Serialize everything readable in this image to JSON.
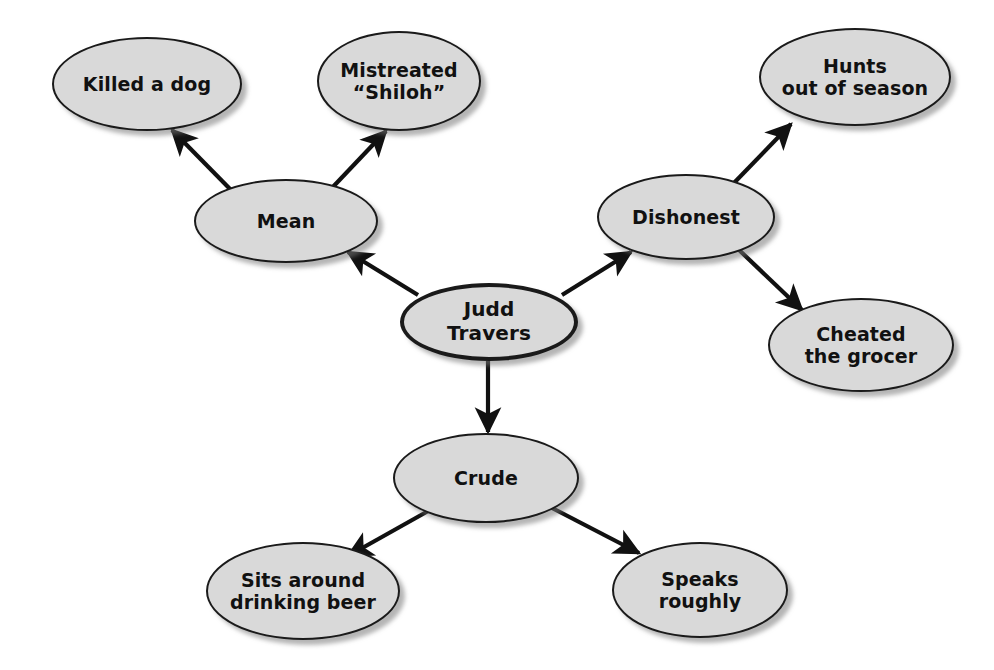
{
  "diagram": {
    "type": "character-trait-web",
    "background_color": "#ffffff",
    "node_fill_color": "#d9d9d9",
    "node_border_color": "#1a1a1a",
    "edge_color": "#111111",
    "center": {
      "id": "judd-travers",
      "label": "Judd\nTravers",
      "x": 489,
      "y": 322,
      "rx": 89,
      "ry": 39,
      "font_size": 20
    },
    "branches": [
      {
        "id": "mean",
        "label": "Mean",
        "x": 286,
        "y": 221,
        "rx": 92,
        "ry": 42,
        "font_size": 19,
        "children": [
          {
            "id": "killed-a-dog",
            "label": "Killed a dog",
            "x": 147,
            "y": 84,
            "rx": 95,
            "ry": 47,
            "font_size": 19
          },
          {
            "id": "mistreated-shiloh",
            "label": "Mistreated\n“Shiloh”",
            "x": 399,
            "y": 81,
            "rx": 82,
            "ry": 50,
            "font_size": 19
          }
        ]
      },
      {
        "id": "dishonest",
        "label": "Dishonest",
        "x": 686,
        "y": 217,
        "rx": 89,
        "ry": 43,
        "font_size": 19,
        "children": [
          {
            "id": "hunts-out-of-season",
            "label": "Hunts\nout of season",
            "x": 855,
            "y": 77,
            "rx": 96,
            "ry": 49,
            "font_size": 19
          },
          {
            "id": "cheated-the-grocer",
            "label": "Cheated\nthe grocer",
            "x": 861,
            "y": 345,
            "rx": 93,
            "ry": 47,
            "font_size": 19
          }
        ]
      },
      {
        "id": "crude",
        "label": "Crude",
        "x": 486,
        "y": 478,
        "rx": 93,
        "ry": 45,
        "font_size": 19,
        "children": [
          {
            "id": "sits-around-drinking-beer",
            "label": "Sits around\ndrinking beer",
            "x": 303,
            "y": 591,
            "rx": 97,
            "ry": 49,
            "font_size": 19
          },
          {
            "id": "speaks-roughly",
            "label": "Speaks\nroughly",
            "x": 700,
            "y": 590,
            "rx": 88,
            "ry": 48,
            "font_size": 19
          }
        ]
      }
    ],
    "edges": [
      {
        "id": "edge-center-to-mean",
        "from": "judd-travers",
        "to": "mean",
        "x1": 418,
        "y1": 295,
        "x2": 348,
        "y2": 252,
        "arrow": "end"
      },
      {
        "id": "edge-center-to-dishonest",
        "from": "judd-travers",
        "to": "dishonest",
        "x1": 562,
        "y1": 295,
        "x2": 631,
        "y2": 252,
        "arrow": "end"
      },
      {
        "id": "edge-center-to-crude",
        "from": "judd-travers",
        "to": "crude",
        "x1": 488,
        "y1": 361,
        "x2": 488,
        "y2": 432,
        "arrow": "end"
      },
      {
        "id": "edge-mean-to-killed-a-dog",
        "from": "mean",
        "to": "killed-a-dog",
        "x1": 231,
        "y1": 190,
        "x2": 172,
        "y2": 130,
        "arrow": "end"
      },
      {
        "id": "edge-mean-to-mistreated-shiloh",
        "from": "mean",
        "to": "mistreated-shiloh",
        "x1": 330,
        "y1": 190,
        "x2": 386,
        "y2": 131,
        "arrow": "end"
      },
      {
        "id": "edge-dishonest-to-hunts-out-of-season",
        "from": "dishonest",
        "to": "hunts-out-of-season",
        "x1": 731,
        "y1": 186,
        "x2": 791,
        "y2": 124,
        "arrow": "end"
      },
      {
        "id": "edge-dishonest-to-cheated-the-grocer",
        "from": "dishonest",
        "to": "cheated-the-grocer",
        "x1": 737,
        "y1": 248,
        "x2": 802,
        "y2": 310,
        "arrow": "end"
      },
      {
        "id": "edge-crude-to-sits-around-drinking-beer",
        "from": "crude",
        "to": "sits-around-drinking-beer",
        "x1": 430,
        "y1": 510,
        "x2": 348,
        "y2": 556,
        "arrow": "end"
      },
      {
        "id": "edge-crude-to-speaks-roughly",
        "from": "crude",
        "to": "speaks-roughly",
        "x1": 552,
        "y1": 508,
        "x2": 639,
        "y2": 553,
        "arrow": "end"
      }
    ]
  }
}
